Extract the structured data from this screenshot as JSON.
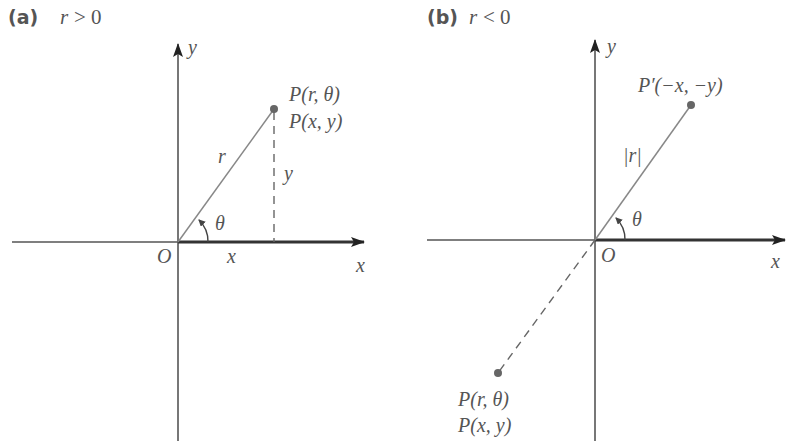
{
  "panels": [
    {
      "id": "a",
      "label": "(a)",
      "condition": "r > 0",
      "condition_var": "r",
      "condition_rel": "> 0",
      "axis_x_label": "x",
      "axis_y_label": "y",
      "origin_label": "O",
      "point_label_polar": "P(r, θ)",
      "point_label_cart": "P(x, y)",
      "radius_label": "r",
      "angle_label": "θ",
      "x_component_label": "x",
      "y_component_label": "y"
    },
    {
      "id": "b",
      "label": "(b)",
      "condition": "r < 0",
      "condition_var": "r",
      "condition_rel": "< 0",
      "axis_x_label": "x",
      "axis_y_label": "y",
      "origin_label": "O",
      "reflected_point_label": "P′(−x, −y)",
      "radius_label": "|r|",
      "angle_label": "θ",
      "point_label_polar": "P(r, θ)",
      "point_label_cart": "P(x, y)"
    }
  ],
  "colors": {
    "line": "#777777",
    "axis": "#333333",
    "text": "#555555",
    "point": "#666666"
  }
}
